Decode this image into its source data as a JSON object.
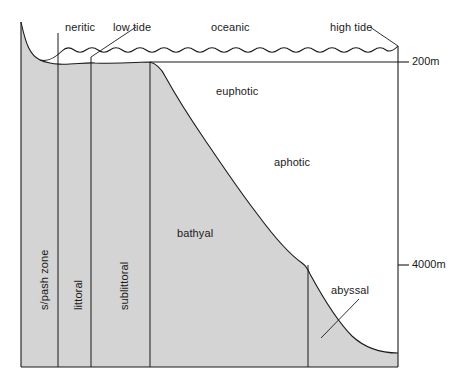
{
  "diagram": {
    "colors": {
      "land_fill": "#d4d4d4",
      "water_fill": "#ffffff",
      "line": "#1a1a1a",
      "text": "#1a1a1a",
      "background": "#ffffff"
    },
    "surface_labels": [
      {
        "id": "neritic",
        "text": "neritic",
        "x": 65,
        "y": 22
      },
      {
        "id": "low-tide",
        "text": "low tide",
        "x": 113,
        "y": 22
      },
      {
        "id": "oceanic",
        "text": "oceanic",
        "x": 211,
        "y": 22
      },
      {
        "id": "high-tide",
        "text": "high tide",
        "x": 330,
        "y": 22
      }
    ],
    "light_zone_labels": [
      {
        "id": "euphotic",
        "text": "euphotic",
        "x": 216,
        "y": 86
      },
      {
        "id": "aphotic",
        "text": "aphotic",
        "x": 274,
        "y": 157
      }
    ],
    "benthic_labels": [
      {
        "id": "bathyal",
        "text": "bathyal",
        "x": 177,
        "y": 228
      },
      {
        "id": "abyssal",
        "text": "abyssal",
        "x": 331,
        "y": 291
      }
    ],
    "vertical_zone_labels": [
      {
        "id": "splash-zone",
        "text": "s/pash zone",
        "x": 39,
        "y": 310
      },
      {
        "id": "littoral",
        "text": "littoral",
        "x": 73,
        "y": 310
      },
      {
        "id": "sublittoral",
        "text": "sublittoral",
        "x": 119,
        "y": 310
      }
    ],
    "depth_markers": [
      {
        "id": "depth-200m",
        "text": "200m",
        "y": 62,
        "tick_x1": 398,
        "tick_x2": 410,
        "label_x": 413
      },
      {
        "id": "depth-4000m",
        "text": "4000m",
        "y": 265,
        "tick_x1": 398,
        "tick_x2": 410,
        "label_x": 413
      }
    ],
    "zone_dividers": [
      {
        "id": "divider-splash-littoral",
        "x": 58,
        "y1": 33,
        "y2": 367
      },
      {
        "id": "divider-littoral-sublittoral",
        "x": 91,
        "y1": 57,
        "y2": 367
      },
      {
        "id": "divider-sublittoral-bathyal",
        "x": 150,
        "y1": 62,
        "y2": 367
      },
      {
        "id": "divider-bathyal-abyssal",
        "x": 308,
        "y1": 265,
        "y2": 367
      }
    ],
    "leader_lines": [
      {
        "id": "low-tide-leader",
        "x1": 134,
        "y1": 27,
        "x2": 91,
        "y2": 57
      },
      {
        "id": "high-tide-leader",
        "x1": 372,
        "y1": 27,
        "x2": 398,
        "y2": 46
      },
      {
        "id": "abyssal-leader",
        "x1": 358,
        "y1": 300,
        "x2": 322,
        "y2": 337
      }
    ],
    "frame": {
      "left": 21,
      "right": 398,
      "top": 22,
      "bottom": 367
    }
  }
}
